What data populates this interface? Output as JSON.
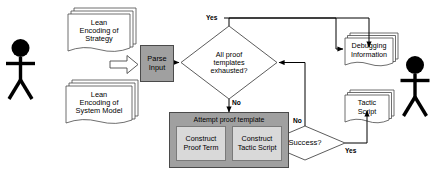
{
  "diagram": {
    "colors": {
      "process_fill": "#a0a0a0",
      "subprocess_fill": "#a0a0a0",
      "inner_fill": "#d9d9d9",
      "stroke": "#4a4a4a",
      "line": "#000000",
      "text": "#000000",
      "background": "#ffffff"
    },
    "actors": [
      {
        "name": "user-actor-left",
        "position": "left"
      },
      {
        "name": "user-actor-right",
        "position": "right"
      }
    ],
    "inputs": [
      {
        "id": "lean-encoding-strategy",
        "lines": [
          "Lean",
          "Encoding of",
          "Strategy"
        ]
      },
      {
        "id": "lean-encoding-system-model",
        "lines": [
          "Lean",
          "Encoding of",
          "System Model"
        ]
      }
    ],
    "process": {
      "parse_input": {
        "lines": [
          "Parse",
          "Input"
        ]
      }
    },
    "decisions": [
      {
        "id": "all-proof-templates-exhausted",
        "lines": [
          "All proof",
          "templates",
          "exhausted?"
        ],
        "branches": [
          {
            "label": "Yes",
            "position": "top"
          },
          {
            "label": "No",
            "position": "bottom"
          }
        ]
      },
      {
        "id": "success",
        "lines": [
          "Success?"
        ],
        "branches": [
          {
            "label": "No",
            "position": "top"
          },
          {
            "label": "Yes",
            "position": "right"
          }
        ]
      }
    ],
    "subprocess": {
      "id": "attempt-proof-template",
      "caption": "Attempt proof template",
      "steps": [
        {
          "id": "construct-proof-term",
          "lines": [
            "Construct",
            "Proof",
            "Term"
          ]
        },
        {
          "id": "construct-tactic-script",
          "lines": [
            "Construct",
            "Tactic",
            "Script"
          ]
        }
      ]
    },
    "outputs": [
      {
        "id": "debugging-information",
        "lines": [
          "Debugging",
          "Information"
        ]
      },
      {
        "id": "tactic-script",
        "lines": [
          "Tactic",
          "Script"
        ]
      }
    ]
  }
}
